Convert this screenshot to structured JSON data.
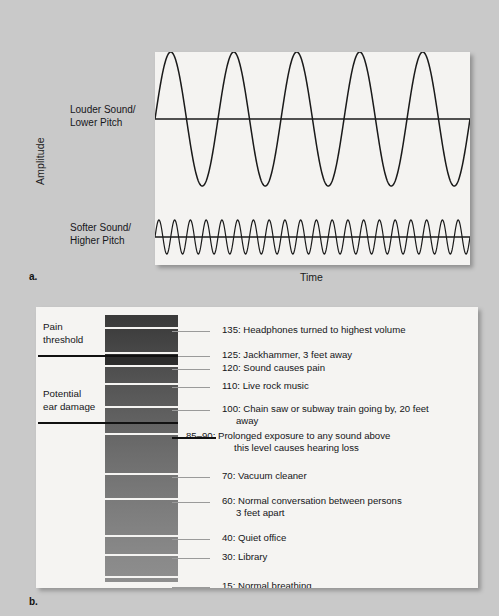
{
  "figure": {
    "background_color": "#c9c9c9",
    "panel_background_color": "#f4f3f1"
  },
  "panel_a": {
    "letter": "a.",
    "y_axis_label": "Amplitude",
    "x_axis_label": "Time",
    "wave_labels": [
      {
        "line1": "Louder Sound/",
        "line2": "Lower Pitch"
      },
      {
        "line1": "Softer Sound/",
        "line2": "Higher Pitch"
      }
    ],
    "chart_data": {
      "type": "line",
      "title": "",
      "xlabel": "Time",
      "ylabel": "Amplitude",
      "grid": false,
      "legend": "none",
      "series": [
        {
          "name": "Louder Sound/Lower Pitch",
          "waveform": "sine",
          "cycles": 5,
          "amplitude": 67,
          "baseline_y": 67,
          "stroke": "#1a1a1a",
          "description": "High-amplitude, low-frequency sine wave"
        },
        {
          "name": "Softer Sound/Higher Pitch",
          "waveform": "sine",
          "cycles": 20,
          "amplitude": 17,
          "baseline_y": 185,
          "stroke": "#1a1a1a",
          "description": "Low-amplitude, high-frequency sine wave"
        }
      ]
    }
  },
  "panel_b": {
    "letter": "b.",
    "left_notes": [
      {
        "line1": "Pain",
        "line2": "threshold"
      },
      {
        "line1": "Potential",
        "line2": "ear damage"
      }
    ],
    "chart_data": {
      "type": "bar",
      "title": "Decibel levels of common sounds",
      "xlabel": "",
      "ylabel": "Decibels (dB)",
      "orientation": "vertical-scale",
      "gradient": "dark (loud, top) to light (quiet, bottom)",
      "thresholds": [
        {
          "label": "Pain threshold",
          "db": 120
        },
        {
          "label": "Potential ear damage",
          "db": 85
        }
      ],
      "categories": [
        "135: Headphones turned to highest volume",
        "125: Jackhammer, 3 feet away",
        "120: Sound causes pain",
        "110: Live rock music",
        "100: Chain saw or subway train going by, 20 feet away",
        "85–90: Prolonged exposure to any sound above this level causes hearing loss",
        "70: Vacuum cleaner",
        "60: Normal conversation between persons 3 feet apart",
        "40: Quiet office",
        "30: Library",
        "15: Normal breathing"
      ],
      "values": [
        135,
        125,
        120,
        110,
        100,
        87.5,
        70,
        60,
        40,
        30,
        15
      ],
      "ylim": [
        0,
        140
      ]
    },
    "scale_items": [
      {
        "value": "135:",
        "text": "Headphones turned to highest volume",
        "cont": "",
        "db": 135,
        "strong": false
      },
      {
        "value": "125:",
        "text": "Jackhammer, 3 feet away",
        "cont": "",
        "db": 125,
        "strong": false
      },
      {
        "value": "120:",
        "text": "Sound causes pain",
        "cont": "",
        "db": 120,
        "strong": false
      },
      {
        "value": "110:",
        "text": "Live rock music",
        "cont": "",
        "db": 110,
        "strong": false
      },
      {
        "value": "100:",
        "text": "Chain saw or subway train going by, 20 feet",
        "cont": "away",
        "db": 100,
        "strong": false
      },
      {
        "value": "85–90:",
        "text": "Prolonged exposure to any sound above",
        "cont": "this level causes hearing loss",
        "db": 87,
        "strong": true
      },
      {
        "value": "70:",
        "text": "Vacuum cleaner",
        "cont": "",
        "db": 70,
        "strong": false
      },
      {
        "value": "60:",
        "text": "Normal conversation between persons",
        "cont": "3 feet apart",
        "db": 60,
        "strong": false
      },
      {
        "value": "40:",
        "text": "Quiet office",
        "cont": "",
        "db": 40,
        "strong": false
      },
      {
        "value": "30:",
        "text": "Library",
        "cont": "",
        "db": 30,
        "strong": false
      },
      {
        "value": "15:",
        "text": "Normal breathing",
        "cont": "",
        "db": 15,
        "strong": false
      }
    ]
  }
}
